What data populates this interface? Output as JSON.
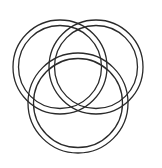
{
  "canvas": {
    "width": 162,
    "height": 168,
    "background_color": "#ffffff",
    "title": "Three Interlocking Rings"
  },
  "style": {
    "line_color": "#2a2a2a",
    "line_width": 1.3,
    "band_gap_color": "#ffffff"
  },
  "figure": {
    "type": "line-art",
    "subject": "three interlocking rings",
    "ring_count": 3,
    "render_style": "double-line band / tube outline",
    "linking": "borromean-style chain"
  },
  "rings": [
    {
      "id": "ring-left",
      "label": "Left Ring",
      "cx": 60,
      "cy": 67,
      "outer_r": 47,
      "inner_r": 41.5
    },
    {
      "id": "ring-right",
      "label": "Right Ring",
      "cx": 96,
      "cy": 67,
      "outer_r": 47,
      "inner_r": 41.5
    },
    {
      "id": "ring-bottom",
      "label": "Bottom Ring",
      "cx": 78,
      "cy": 103,
      "outer_r": 50,
      "inner_r": 44.5
    }
  ],
  "crossings": [
    {
      "id": "crossing-top",
      "x": 78,
      "y": 25,
      "over": "ring-left",
      "under": "ring-right"
    },
    {
      "id": "crossing-center",
      "x": 78,
      "y": 109,
      "over": "ring-right",
      "under": "ring-left"
    },
    {
      "id": "crossing-left-lower",
      "x": 36,
      "y": 101,
      "over": "ring-bottom",
      "under": "ring-left"
    },
    {
      "id": "crossing-left-inner",
      "x": 72,
      "y": 64,
      "over": "ring-left",
      "under": "ring-bottom"
    },
    {
      "id": "crossing-right-lower",
      "x": 120,
      "y": 101,
      "over": "ring-right",
      "under": "ring-bottom"
    },
    {
      "id": "crossing-right-inner",
      "x": 84,
      "y": 64,
      "over": "ring-bottom",
      "under": "ring-right"
    }
  ]
}
